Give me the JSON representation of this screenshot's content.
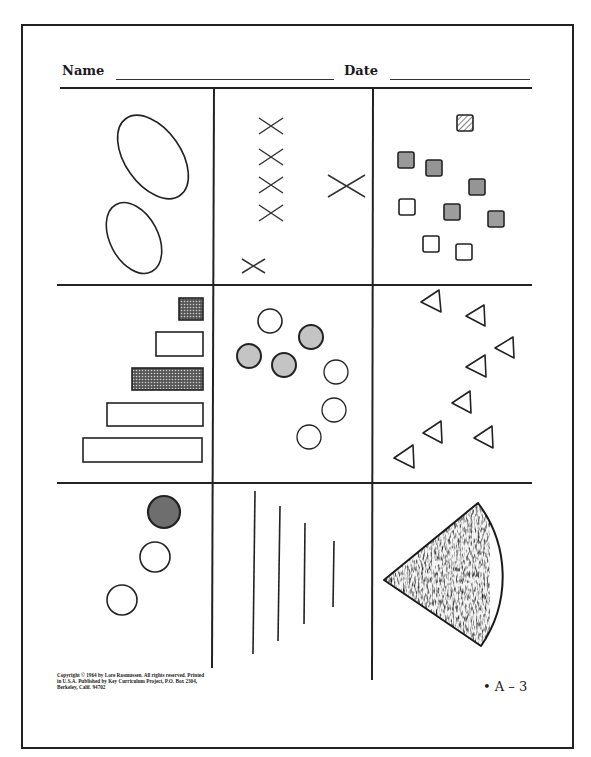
{
  "header": {
    "name_label": "Name",
    "date_label": "Date",
    "name_value": "",
    "date_value": ""
  },
  "footer": {
    "copyright": "Copyright © 1964 by Lore Rasmussen. All rights reserved. Printed in U.S.A. Published by Key Curriculum Project, P.O. Box 2304, Berkeley, Calif. 94702",
    "page_label": "• A – 3"
  },
  "colors": {
    "ink": "#222222",
    "shade_gray": "#9a9a9a",
    "dark_fill": "#6a6a6a",
    "paper": "#ffffff"
  },
  "grid": {
    "rows": 3,
    "cols": 3,
    "col_dividers_x": [
      213,
      372
    ],
    "row_dividers_y": [
      88,
      285,
      483
    ]
  },
  "cells": [
    {
      "id": "ovals",
      "description": "two outline ovals",
      "shapes": [
        {
          "type": "ellipse",
          "cx": 153,
          "cy": 157,
          "rx": 47,
          "ry": 28,
          "rotate": 55,
          "fill": "none"
        },
        {
          "type": "ellipse",
          "cx": 134,
          "cy": 238,
          "rx": 38,
          "ry": 24,
          "rotate": 62,
          "fill": "none"
        }
      ]
    },
    {
      "id": "crosses",
      "description": "six X marks",
      "shapes": [
        {
          "type": "x",
          "cx": 271,
          "cy": 126,
          "size": 12
        },
        {
          "type": "x",
          "cx": 271,
          "cy": 157,
          "size": 12
        },
        {
          "type": "x",
          "cx": 271,
          "cy": 185,
          "size": 12
        },
        {
          "type": "x",
          "cx": 271,
          "cy": 213,
          "size": 12
        },
        {
          "type": "x",
          "cx": 347,
          "cy": 186,
          "size": 18
        },
        {
          "type": "x",
          "cx": 253,
          "cy": 266,
          "size": 11
        }
      ]
    },
    {
      "id": "squares",
      "description": "ten small squares, mixed fills",
      "shapes": [
        {
          "type": "square",
          "x": 457,
          "y": 115,
          "size": 16,
          "fill": "hatch"
        },
        {
          "type": "square",
          "x": 398,
          "y": 152,
          "size": 16,
          "fill": "gray"
        },
        {
          "type": "square",
          "x": 426,
          "y": 160,
          "size": 16,
          "fill": "gray"
        },
        {
          "type": "square",
          "x": 469,
          "y": 179,
          "size": 16,
          "fill": "gray"
        },
        {
          "type": "square",
          "x": 399,
          "y": 199,
          "size": 16,
          "fill": "none"
        },
        {
          "type": "square",
          "x": 444,
          "y": 204,
          "size": 16,
          "fill": "gray"
        },
        {
          "type": "square",
          "x": 488,
          "y": 211,
          "size": 16,
          "fill": "gray"
        },
        {
          "type": "square",
          "x": 423,
          "y": 236,
          "size": 16,
          "fill": "none"
        },
        {
          "type": "square",
          "x": 456,
          "y": 244,
          "size": 16,
          "fill": "none"
        }
      ]
    },
    {
      "id": "bars",
      "description": "five horizontal bars of increasing length",
      "shapes": [
        {
          "type": "rect",
          "x": 179,
          "y": 298,
          "w": 24,
          "h": 22,
          "fill": "dots"
        },
        {
          "type": "rect",
          "x": 156,
          "y": 332,
          "w": 47,
          "h": 24,
          "fill": "none"
        },
        {
          "type": "rect",
          "x": 132,
          "y": 368,
          "w": 71,
          "h": 22,
          "fill": "dots"
        },
        {
          "type": "rect",
          "x": 107,
          "y": 403,
          "w": 96,
          "h": 23,
          "fill": "none"
        },
        {
          "type": "rect",
          "x": 83,
          "y": 438,
          "w": 119,
          "h": 24,
          "fill": "none"
        }
      ]
    },
    {
      "id": "circles",
      "description": "seven circles, four shaded",
      "shapes": [
        {
          "type": "circle",
          "cx": 270,
          "cy": 321,
          "r": 12,
          "fill": "none"
        },
        {
          "type": "circle",
          "cx": 311,
          "cy": 337,
          "r": 12,
          "fill": "gray"
        },
        {
          "type": "circle",
          "cx": 249,
          "cy": 356,
          "r": 12,
          "fill": "gray"
        },
        {
          "type": "circle",
          "cx": 284,
          "cy": 365,
          "r": 12,
          "fill": "gray"
        },
        {
          "type": "circle",
          "cx": 336,
          "cy": 372,
          "r": 12,
          "fill": "none"
        },
        {
          "type": "circle",
          "cx": 334,
          "cy": 410,
          "r": 12,
          "fill": "none"
        },
        {
          "type": "circle",
          "cx": 309,
          "cy": 437,
          "r": 12,
          "fill": "none"
        }
      ]
    },
    {
      "id": "triangles",
      "description": "eight left-pointing outline triangles",
      "shapes": [
        {
          "type": "triangle",
          "cx": 432,
          "cy": 301,
          "size": 12
        },
        {
          "type": "triangle",
          "cx": 478,
          "cy": 314,
          "size": 12
        },
        {
          "type": "triangle",
          "cx": 507,
          "cy": 346,
          "size": 12
        },
        {
          "type": "triangle",
          "cx": 478,
          "cy": 365,
          "size": 12
        },
        {
          "type": "triangle",
          "cx": 464,
          "cy": 402,
          "size": 12
        },
        {
          "type": "triangle",
          "cx": 435,
          "cy": 432,
          "size": 12
        },
        {
          "type": "triangle",
          "cx": 486,
          "cy": 436,
          "size": 12
        },
        {
          "type": "triangle",
          "cx": 406,
          "cy": 456,
          "size": 12
        }
      ]
    },
    {
      "id": "dots",
      "description": "three circles diagonal, top one dark",
      "shapes": [
        {
          "type": "circle",
          "cx": 164,
          "cy": 512,
          "r": 16,
          "fill": "dark"
        },
        {
          "type": "circle",
          "cx": 155,
          "cy": 557,
          "r": 15,
          "fill": "none"
        },
        {
          "type": "circle",
          "cx": 122,
          "cy": 600,
          "r": 15,
          "fill": "none"
        }
      ]
    },
    {
      "id": "lines",
      "description": "four vertical lines of decreasing length",
      "shapes": [
        {
          "type": "line",
          "x1": 255,
          "y1": 491,
          "x2": 253,
          "y2": 654
        },
        {
          "type": "line",
          "x1": 280,
          "y1": 506,
          "x2": 278,
          "y2": 641
        },
        {
          "type": "line",
          "x1": 305,
          "y1": 523,
          "x2": 304,
          "y2": 624
        },
        {
          "type": "line",
          "x1": 334,
          "y1": 541,
          "x2": 333,
          "y2": 607
        }
      ]
    },
    {
      "id": "sector",
      "description": "speckled circular sector (pie wedge)",
      "shapes": [
        {
          "type": "sector",
          "apex_x": 384,
          "apex_y": 580,
          "p1_x": 478,
          "p1_y": 503,
          "p2_x": 481,
          "p2_y": 646,
          "radius": 122,
          "fill": "speckle"
        }
      ]
    }
  ]
}
